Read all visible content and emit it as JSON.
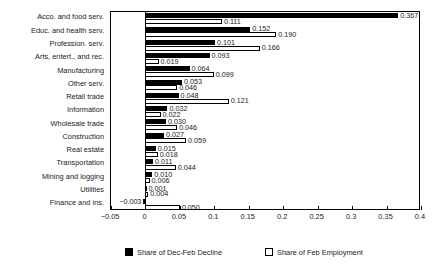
{
  "chart_data": {
    "type": "bar",
    "orientation": "horizontal",
    "title": "",
    "subtitle": "",
    "xlabel": "",
    "ylabel": "",
    "xlim": [
      -0.05,
      0.4
    ],
    "xticks": [
      -0.05,
      0,
      0.05,
      0.1,
      0.15,
      0.2,
      0.25,
      0.3,
      0.35,
      0.4
    ],
    "xtick_labels": [
      "−0.05",
      "0",
      "0.05",
      "0.1",
      "0.15",
      "0.2",
      "0.25",
      "0.3",
      "0.35",
      "0.4"
    ],
    "grid": false,
    "legend_position": "below",
    "categories": [
      "Acco. and food serv.",
      "Educ. and health serv.",
      "Profession. serv.",
      "Arts, entert., and rec.",
      "Manufacturing",
      "Other serv.",
      "Retail trade",
      "Information",
      "Wholesale trade",
      "Construction",
      "Real estate",
      "Transportation",
      "Mining and logging",
      "Utilities",
      "Finance and ins."
    ],
    "series": [
      {
        "name": "Share of Dec-Feb Decline",
        "color": "#000000",
        "style": "filled",
        "values": [
          0.367,
          0.152,
          0.101,
          0.093,
          0.064,
          0.053,
          0.048,
          0.032,
          0.03,
          0.027,
          0.015,
          0.011,
          0.01,
          0.001,
          -0.003
        ],
        "labels": [
          "0.367",
          "0.152",
          "0.101",
          "0.093",
          "0.064",
          "0.053",
          "0.048",
          "0.032",
          "0.030",
          "0.027",
          "0.015",
          "0.011",
          "0.010",
          "0.001",
          "−0.003"
        ]
      },
      {
        "name": "Share of Feb Employment",
        "color": "#ffffff",
        "style": "hollow",
        "values": [
          0.111,
          0.19,
          0.166,
          0.019,
          0.099,
          0.046,
          0.121,
          0.022,
          0.046,
          0.059,
          0.018,
          0.044,
          0.006,
          0.004,
          0.05
        ],
        "labels": [
          "0.111",
          "0.190",
          "0.166",
          "0.019",
          "0.099",
          "0.046",
          "0.121",
          "0.022",
          "0.046",
          "0.059",
          "0.018",
          "0.044",
          "0.006",
          "0.004",
          "0.050"
        ]
      }
    ]
  },
  "legend": {
    "items": [
      {
        "label": "Share of Dec-Feb Decline",
        "swatch": "dark"
      },
      {
        "label": "Share of Feb Employment",
        "swatch": "light"
      }
    ]
  }
}
